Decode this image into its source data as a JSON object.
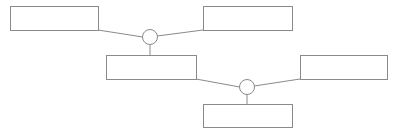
{
  "canvas": {
    "width": 398,
    "height": 134,
    "background": "#ffffff",
    "stroke_color": "#8a8a8a",
    "fill_color": "#ffffff",
    "title": ""
  },
  "diagram": {
    "type": "node-link",
    "boxes": [
      {
        "id": "box-top-left",
        "label": "",
        "x": 10,
        "y": 6,
        "width": 88,
        "height": 24
      },
      {
        "id": "box-top-right",
        "label": "",
        "x": 203,
        "y": 6,
        "width": 89,
        "height": 24
      },
      {
        "id": "box-middle-left",
        "label": "",
        "x": 106,
        "y": 55,
        "width": 90,
        "height": 24
      },
      {
        "id": "box-middle-right",
        "label": "",
        "x": 300,
        "y": 55,
        "width": 88,
        "height": 24
      },
      {
        "id": "box-bottom",
        "label": "",
        "x": 203,
        "y": 104,
        "width": 89,
        "height": 23
      }
    ],
    "junctions": [
      {
        "id": "junction-upper",
        "label": "",
        "cx": 150,
        "cy": 37,
        "r": 7.5
      },
      {
        "id": "junction-lower",
        "label": "",
        "cx": 247,
        "cy": 87,
        "r": 7.5
      }
    ],
    "links": [
      {
        "id": "link-top-left-to-junction-upper",
        "x1": 98,
        "y1": 30,
        "x2": 142.7,
        "y2": 37
      },
      {
        "id": "link-junction-upper-to-top-right",
        "x1": 157.3,
        "y1": 36,
        "x2": 203,
        "y2": 30
      },
      {
        "id": "link-junction-upper-to-middle-left",
        "x1": 150,
        "y1": 44.5,
        "x2": 150,
        "y2": 55
      },
      {
        "id": "link-middle-left-to-junction-lower",
        "x1": 196,
        "y1": 79,
        "x2": 239.7,
        "y2": 87
      },
      {
        "id": "link-junction-lower-to-middle-right",
        "x1": 254.3,
        "y1": 86,
        "x2": 300,
        "y2": 79
      },
      {
        "id": "link-junction-lower-to-bottom",
        "x1": 247,
        "y1": 94.5,
        "x2": 247,
        "y2": 104
      }
    ]
  }
}
